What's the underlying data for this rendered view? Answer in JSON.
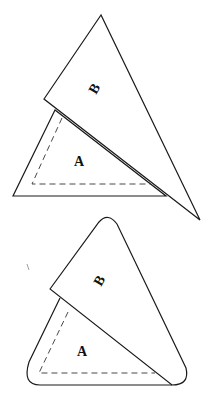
{
  "figures": [
    {
      "id": "sharp",
      "description": "Triangle B overlapping triangle A, sharp corners",
      "triangle_a": {
        "label": "A"
      },
      "triangle_b": {
        "label": "B"
      }
    },
    {
      "id": "rounded",
      "description": "Triangle B overlapping triangle A, rounded corners",
      "triangle_a": {
        "label": "A"
      },
      "triangle_b": {
        "label": "B"
      }
    }
  ],
  "colors": {
    "stroke": "#1a1a1a",
    "dash": "#333333",
    "background": "#ffffff"
  }
}
